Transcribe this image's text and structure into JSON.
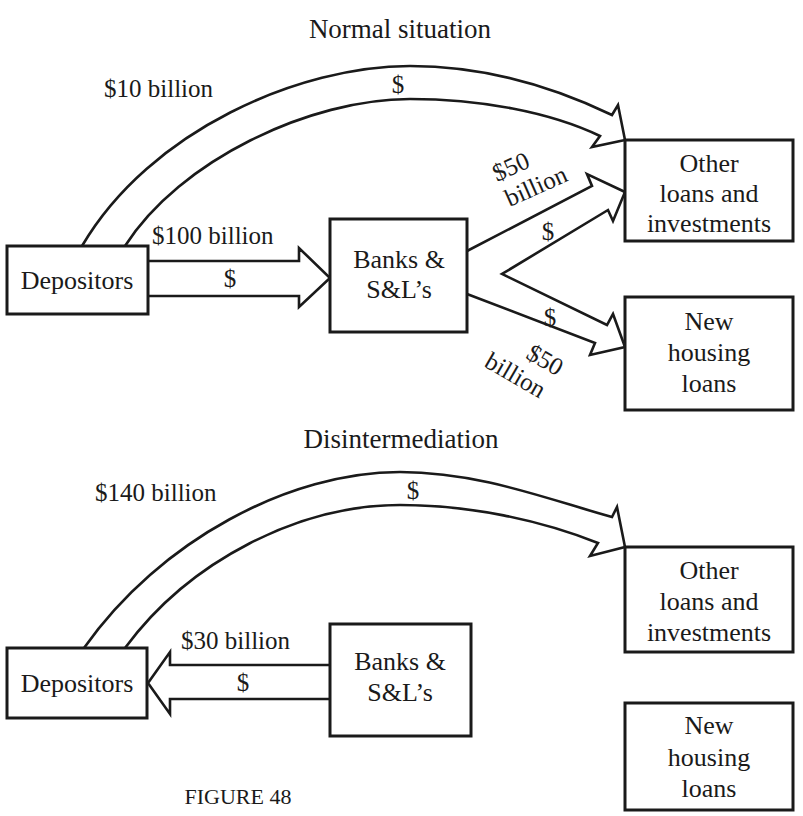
{
  "figure": {
    "caption": "FIGURE 48",
    "colors": {
      "ink": "#1a1a1a",
      "background": "#ffffff"
    }
  },
  "normal": {
    "title": "Normal situation",
    "nodes": {
      "depositors": "Depositors",
      "banks_line1": "Banks &",
      "banks_line2": "S&L’s",
      "other_line1": "Other",
      "other_line2": "loans and",
      "other_line3": "investments",
      "housing_line1": "New",
      "housing_line2": "housing",
      "housing_line3": "loans"
    },
    "flows": {
      "direct": {
        "amount": "$10 billion",
        "symbol": "$",
        "from": "Depositors",
        "to": "Other loans and investments"
      },
      "deposits": {
        "amount": "$100 billion",
        "symbol": "$",
        "from": "Depositors",
        "to": "Banks & S&L’s"
      },
      "to_other": {
        "amount_line1": "$50",
        "amount_line2": "billion",
        "symbol": "$",
        "from": "Banks & S&L’s",
        "to": "Other loans and investments"
      },
      "to_housing": {
        "amount_line1": "$50",
        "amount_line2": "billion",
        "symbol": "$",
        "from": "Banks & S&L’s",
        "to": "New housing loans"
      }
    }
  },
  "disintermediation": {
    "title": "Disintermediation",
    "nodes": {
      "depositors": "Depositors",
      "banks_line1": "Banks &",
      "banks_line2": "S&L’s",
      "other_line1": "Other",
      "other_line2": "loans and",
      "other_line3": "investments",
      "housing_line1": "New",
      "housing_line2": "housing",
      "housing_line3": "loans"
    },
    "flows": {
      "direct": {
        "amount": "$140 billion",
        "symbol": "$",
        "from": "Depositors",
        "to": "Other loans and investments"
      },
      "withdrawals": {
        "amount": "$30 billion",
        "symbol": "$",
        "from": "Banks & S&L’s",
        "to": "Depositors"
      }
    }
  }
}
